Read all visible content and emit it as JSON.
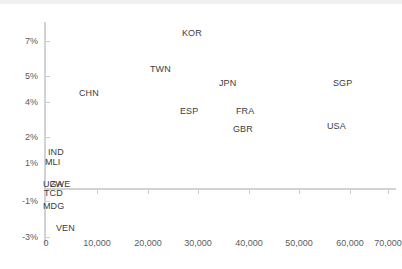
{
  "chart_data": {
    "type": "scatter",
    "title": "",
    "subtitle": "",
    "xlabel": "",
    "ylabel": "",
    "grid": false,
    "legend": "none",
    "xlim": [
      0,
      72000
    ],
    "ylim": [
      -3,
      8
    ],
    "x_ticks": [
      {
        "value": 0,
        "label": "0",
        "px": 46
      },
      {
        "value": 10000,
        "label": "10,000",
        "px": 97
      },
      {
        "value": 20000,
        "label": "20,000",
        "px": 148
      },
      {
        "value": 30000,
        "label": "30,000",
        "px": 198
      },
      {
        "value": 40000,
        "label": "40,000",
        "px": 249
      },
      {
        "value": 50000,
        "label": "50,000",
        "px": 299
      },
      {
        "value": 60000,
        "label": "60,000",
        "px": 350
      },
      {
        "value": 70000,
        "label": "70,000",
        "px": 388
      }
    ],
    "y_ticks": [
      {
        "value": 7,
        "label": "7%",
        "px": 41
      },
      {
        "value": 5,
        "label": "5%",
        "px": 76
      },
      {
        "value": 4,
        "label": "4%",
        "px": 102
      },
      {
        "value": 2,
        "label": "2%",
        "px": 137
      },
      {
        "value": 1,
        "label": "1%",
        "px": 163
      },
      {
        "value": -1,
        "label": "-1%",
        "px": 201
      },
      {
        "value": -3,
        "label": "-3%",
        "px": 237
      }
    ],
    "axis_origin": {
      "x_px": 44,
      "y_px": 188
    },
    "points": [
      {
        "label": "KOR",
        "x": 27500,
        "y": 7.7,
        "lx": 182,
        "ly": 28
      },
      {
        "label": "TWN",
        "x": 22500,
        "y": 5.5,
        "lx": 150,
        "ly": 64
      },
      {
        "label": "CHN",
        "x": 8000,
        "y": 4.5,
        "lx": 79,
        "ly": 88
      },
      {
        "label": "JPN",
        "x": 36000,
        "y": 5.0,
        "lx": 219,
        "ly": 78
      },
      {
        "label": "SGP",
        "x": 58500,
        "y": 5.0,
        "lx": 333,
        "ly": 78
      },
      {
        "label": "ESP",
        "x": 30500,
        "y": 3.8,
        "lx": 180,
        "ly": 106
      },
      {
        "label": "FRA",
        "x": 39000,
        "y": 3.8,
        "lx": 236,
        "ly": 106
      },
      {
        "label": "GBR",
        "x": 38500,
        "y": 2.6,
        "lx": 233,
        "ly": 124
      },
      {
        "label": "USA",
        "x": 57500,
        "y": 2.6,
        "lx": 327,
        "ly": 121
      },
      {
        "label": "IND",
        "x": 1200,
        "y": 1.7,
        "lx": 48,
        "ly": 147
      },
      {
        "label": "MLI",
        "x": 900,
        "y": 1.2,
        "lx": 45,
        "ly": 157
      },
      {
        "label": "UGA",
        "x": 900,
        "y": 0.1,
        "lx": 43,
        "ly": 179
      },
      {
        "label": "ZWE",
        "x": 1100,
        "y": 0.1,
        "lx": 50,
        "ly": 179
      },
      {
        "label": "TCD",
        "x": 800,
        "y": -0.5,
        "lx": 44,
        "ly": 188
      },
      {
        "label": "MDG",
        "x": 800,
        "y": -1.2,
        "lx": 43,
        "ly": 201
      },
      {
        "label": "VEN",
        "x": 1800,
        "y": -2.6,
        "lx": 56,
        "ly": 223
      }
    ]
  },
  "colors": {
    "axis": "#d2d2d2",
    "tick": "#cfcfcf",
    "tick_label": "#5b5b5b",
    "point_label": "#3d3d3d",
    "background": "#ffffff",
    "top_band": "#f0f0f0"
  }
}
